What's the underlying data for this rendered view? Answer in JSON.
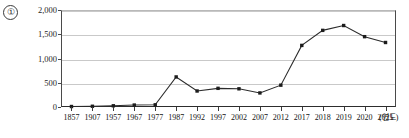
{
  "figure": {
    "marker_number": "①",
    "unit_label": "(연도)"
  },
  "chart_data": {
    "type": "line",
    "title": "",
    "xlabel": "(연도)",
    "ylabel": "",
    "categories": [
      "1857",
      "1907",
      "1957",
      "1967",
      "1977",
      "1987",
      "1992",
      "1997",
      "2002",
      "2007",
      "2012",
      "2017",
      "2018",
      "2019",
      "2020",
      "2021"
    ],
    "values": [
      10,
      15,
      25,
      40,
      45,
      620,
      330,
      385,
      375,
      290,
      450,
      1270,
      1580,
      1680,
      1450,
      1330
    ],
    "series": [
      {
        "name": "",
        "values": [
          10,
          15,
          25,
          40,
          45,
          620,
          330,
          385,
          375,
          290,
          450,
          1270,
          1580,
          1680,
          1450,
          1330
        ]
      }
    ],
    "ylim": [
      0,
      2000
    ],
    "yticks": [
      0,
      500,
      1000,
      1500,
      2000
    ],
    "ytick_labels": [
      "0",
      "500",
      "1,000",
      "1,500",
      "2,000"
    ],
    "grid": true,
    "legend": "none",
    "marker_shape": "square",
    "line_color": "#2b2b2b"
  }
}
